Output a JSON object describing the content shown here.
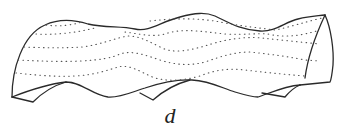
{
  "figure": {
    "type": "line-drawing",
    "label": "d",
    "colors": {
      "stroke": "#2a2a2a",
      "dots": "#555555",
      "background": "#ffffff"
    },
    "dotted_lines_count": 5
  }
}
